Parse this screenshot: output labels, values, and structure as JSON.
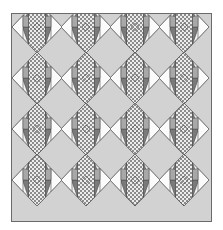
{
  "image": {
    "kind": "quilt-pattern-diagram",
    "width_px": 223,
    "height_px": 230,
    "background_color": "#ffffff"
  },
  "quilt": {
    "name": "on-point-diamond-quilt",
    "border_color": "#6b6b6b",
    "border_width_px": 1,
    "sashing_background_color": "#d2d2d2",
    "grid": {
      "columns": 4,
      "rows": 4
    },
    "block": {
      "name": "checkerboard-diamond-block",
      "width_px": 50,
      "height_px": 52,
      "set": "on-point"
    },
    "palette": {
      "background": "#d2d2d2",
      "light": "#f2f2f2",
      "white": "#fbfbfb",
      "medium_gray": "#a8a8a8",
      "dark_gray": "#7a7a7a",
      "darkest_gray": "#5c5c5c",
      "outline": "#4a4a4a",
      "checker_light": "#ededed",
      "checker_dark": "#8c8c8c"
    },
    "patches": [
      {
        "label": "checkerboard-vertical-strip",
        "colors": [
          "#ededed",
          "#8c8c8c"
        ]
      },
      {
        "label": "left-dark-triangle",
        "colors": [
          "#7a7a7a"
        ]
      },
      {
        "label": "right-dark-triangle",
        "colors": [
          "#7a7a7a"
        ]
      },
      {
        "label": "corner-white-triangle",
        "colors": [
          "#fbfbfb"
        ]
      },
      {
        "label": "light-filler-triangle",
        "colors": [
          "#f2f2f2"
        ]
      }
    ],
    "block_centers": [
      {
        "col": 0,
        "row": 0,
        "cx": 37,
        "cy": 27
      },
      {
        "col": 1,
        "row": 0,
        "cx": 86,
        "cy": 27
      },
      {
        "col": 2,
        "row": 0,
        "cx": 135,
        "cy": 27
      },
      {
        "col": 3,
        "row": 0,
        "cx": 184,
        "cy": 27
      },
      {
        "col": 0,
        "row": 1,
        "cx": 37,
        "cy": 78
      },
      {
        "col": 1,
        "row": 1,
        "cx": 86,
        "cy": 78
      },
      {
        "col": 2,
        "row": 1,
        "cx": 135,
        "cy": 78
      },
      {
        "col": 3,
        "row": 1,
        "cx": 184,
        "cy": 78
      },
      {
        "col": 0,
        "row": 2,
        "cx": 37,
        "cy": 129
      },
      {
        "col": 1,
        "row": 2,
        "cx": 86,
        "cy": 129
      },
      {
        "col": 2,
        "row": 2,
        "cx": 135,
        "cy": 129
      },
      {
        "col": 3,
        "row": 2,
        "cx": 184,
        "cy": 129
      },
      {
        "col": 0,
        "row": 3,
        "cx": 37,
        "cy": 180
      },
      {
        "col": 1,
        "row": 3,
        "cx": 86,
        "cy": 180
      },
      {
        "col": 2,
        "row": 3,
        "cx": 135,
        "cy": 180
      },
      {
        "col": 3,
        "row": 3,
        "cx": 184,
        "cy": 180
      }
    ]
  }
}
